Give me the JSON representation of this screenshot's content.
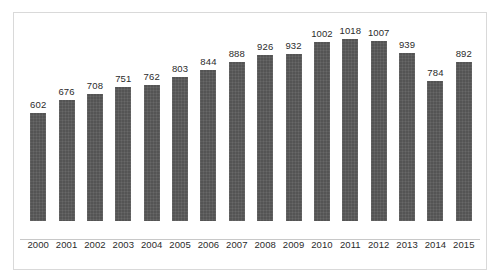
{
  "chart_data": {
    "type": "bar",
    "title": "",
    "subtitle": "",
    "xlabel": "",
    "ylabel": "",
    "categories": [
      "2000",
      "2001",
      "2002",
      "2003",
      "2004",
      "2005",
      "2006",
      "2007",
      "2008",
      "2009",
      "2010",
      "2011",
      "2012",
      "2013",
      "2014",
      "2015"
    ],
    "values": [
      602,
      676,
      708,
      751,
      762,
      803,
      844,
      888,
      926,
      932,
      1002,
      1018,
      1007,
      939,
      784,
      892
    ],
    "data_labels": [
      "602",
      "676",
      "708",
      "751",
      "762",
      "803",
      "844",
      "888",
      "926",
      "932",
      "1002",
      "1018",
      "1007",
      "939",
      "784",
      "892"
    ],
    "ylim": [
      0,
      1100
    ],
    "grid": false,
    "legend": null,
    "legend_position": "none",
    "series": [
      {
        "name": "",
        "values": [
          602,
          676,
          708,
          751,
          762,
          803,
          844,
          888,
          926,
          932,
          1002,
          1018,
          1007,
          939,
          784,
          892
        ]
      }
    ],
    "colors": {
      "bar": "#595959",
      "background": "#ffffff",
      "border": "#d9d9d9",
      "axis_line": "#c8c8c8",
      "label_text": "#2b2b2b"
    }
  }
}
